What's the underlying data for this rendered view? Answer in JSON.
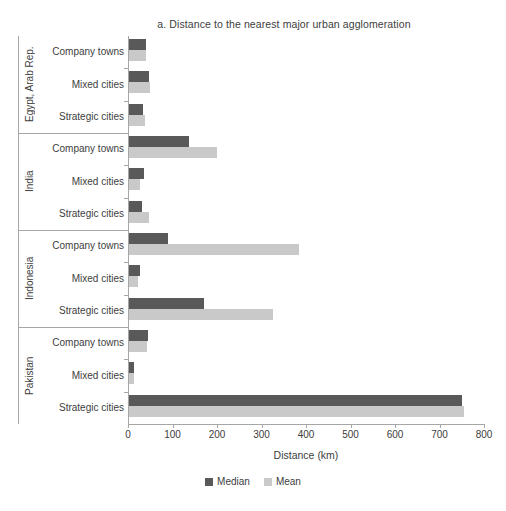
{
  "chart_data": {
    "type": "bar",
    "orientation": "horizontal",
    "title": "a. Distance to the nearest major urban agglomeration",
    "xlabel": "Distance (km)",
    "ylabel": "",
    "xlim": [
      0,
      800
    ],
    "xticks": [
      0,
      100,
      200,
      300,
      400,
      500,
      600,
      700,
      800
    ],
    "xticklabels": [
      "0",
      "100",
      "200",
      "300",
      "400",
      "500",
      "600",
      "700",
      "800"
    ],
    "grid": false,
    "legend": {
      "position": "bottom-center",
      "entries": [
        {
          "name": "Median",
          "color": "#595959"
        },
        {
          "name": "Mean",
          "color": "#c9c9c9"
        }
      ]
    },
    "series": [
      {
        "name": "Median",
        "color": "#595959"
      },
      {
        "name": "Mean",
        "color": "#c9c9c9"
      }
    ],
    "groups": [
      {
        "country": "Egypt, Arab Rep.",
        "categories": [
          "Company towns",
          "Mixed cities",
          "Strategic cities"
        ],
        "median": [
          38,
          45,
          32
        ],
        "mean": [
          39,
          47,
          37
        ]
      },
      {
        "country": "India",
        "categories": [
          "Company towns",
          "Mixed cities",
          "Strategic cities"
        ],
        "median": [
          135,
          34,
          29
        ],
        "mean": [
          198,
          25,
          45
        ]
      },
      {
        "country": "Indonesia",
        "categories": [
          "Company towns",
          "Mixed cities",
          "Strategic cities"
        ],
        "median": [
          88,
          25,
          169
        ],
        "mean": [
          381,
          20,
          324
        ]
      },
      {
        "country": "Pakistan",
        "categories": [
          "Company towns",
          "Mixed cities",
          "Strategic cities"
        ],
        "median": [
          42,
          11,
          748
        ],
        "mean": [
          40,
          11,
          752
        ]
      }
    ]
  },
  "colors": {
    "median": "#595959",
    "mean": "#c9c9c9",
    "axis": "#a6a6a6",
    "text": "#404040",
    "background": "#ffffff"
  }
}
